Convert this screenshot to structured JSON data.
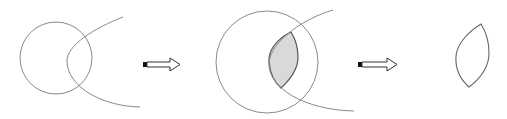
{
  "diagram": {
    "colors": {
      "background": "#ffffff",
      "stroke": "#8a8a8a",
      "lens_stroke": "#555555",
      "lens_fill": "#d9d9d9",
      "arrow_tail": "#111111"
    },
    "steps": [
      {
        "id": "step-1",
        "label": "circle and curve intersect"
      },
      {
        "id": "step-2",
        "label": "intersection region shaded"
      },
      {
        "id": "step-3",
        "label": "lens shape extracted"
      }
    ],
    "arrows": [
      {
        "id": "arrow-1",
        "direction": "right"
      },
      {
        "id": "arrow-2",
        "direction": "right"
      }
    ]
  }
}
